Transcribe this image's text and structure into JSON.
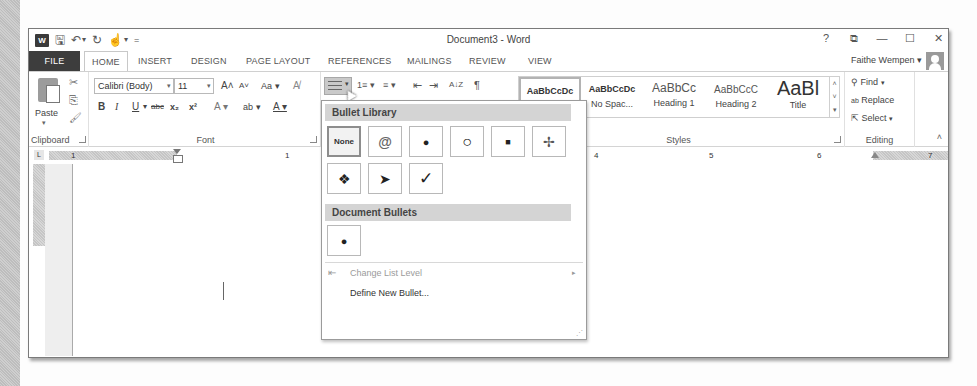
{
  "window": {
    "title": "Document3 - Word",
    "controls": [
      "?",
      "ribbon-display-options",
      "minimize",
      "maximize",
      "close"
    ],
    "control_glyphs": [
      "?",
      "⧉",
      "—",
      "☐",
      "✕"
    ],
    "user_name": "Faithe Wempen",
    "user_dropdown": "▾"
  },
  "quick_access": {
    "app_icon": "W",
    "save": "🖫",
    "undo": "↶",
    "undo_dd": "▾",
    "redo": "↻",
    "touch": "☝",
    "touch_dd": "▾",
    "customize": "="
  },
  "tabs": [
    {
      "label": "FILE",
      "x": 0
    },
    {
      "label": "HOME",
      "x": 55,
      "active": true
    },
    {
      "label": "INSERT",
      "x": 103
    },
    {
      "label": "DESIGN",
      "x": 152
    },
    {
      "label": "PAGE LAYOUT",
      "x": 207
    },
    {
      "label": "REFERENCES",
      "x": 292
    },
    {
      "label": "MAILINGS",
      "x": 371
    },
    {
      "label": "REVIEW",
      "x": 434
    },
    {
      "label": "VIEW",
      "x": 490
    }
  ],
  "ribbon": {
    "clipboard": {
      "label": "Clipboard",
      "paste_label": "Paste",
      "paste_dd": "▾",
      "cut_icon": "✂",
      "copy_icon": "⎘",
      "format_painter_icon": "🖌"
    },
    "font": {
      "label": "Font",
      "font_name": "Calibri (Body)",
      "font_size": "11",
      "grow": "A˄",
      "shrink": "A˅",
      "change_case": "Aa ▾",
      "clear_format": "A̸",
      "bold": "B",
      "italic": "I",
      "underline": "U",
      "underline_dd": "▾",
      "strikethrough": "abc",
      "subscript": "x₂",
      "superscript": "x²",
      "text_effects": "A ▾",
      "highlight": "ab ▾",
      "font_color": "A ▾"
    },
    "paragraph": {
      "numbering": "1≡ ▾",
      "multilevel": "≡ ▾",
      "decrease_indent": "⇤",
      "increase_indent": "⇥",
      "sort": "A↓Z",
      "show_marks": "¶"
    },
    "styles": {
      "label": "Styles",
      "items": [
        {
          "preview": "AaBbCcDc",
          "name": "Normal",
          "selected": true
        },
        {
          "preview": "AaBbCcDc",
          "name": "No Spac..."
        },
        {
          "preview": "AaBbCc",
          "name": "Heading 1"
        },
        {
          "preview": "AaBbCcC",
          "name": "Heading 2"
        },
        {
          "preview": "AaBl",
          "name": "Title"
        }
      ],
      "scroll_up": "˄",
      "scroll_down": "˅",
      "more": "▾"
    },
    "editing": {
      "label": "Editing",
      "find": "Find",
      "find_dd": "▾",
      "replace": "Replace",
      "select": "Select",
      "select_dd": "▾",
      "collapse": "˄"
    }
  },
  "ruler": {
    "tab_selector": "L",
    "numbers": [
      {
        "label": "1",
        "x": 70
      },
      {
        "label": "1",
        "x": 256
      },
      {
        "label": "4",
        "x": 593
      },
      {
        "label": "5",
        "x": 698
      },
      {
        "label": "6",
        "x": 803
      },
      {
        "label": "7",
        "x": 898
      }
    ]
  },
  "bullet_menu": {
    "library_header": "Bullet Library",
    "library": [
      {
        "glyph": "None",
        "name": "none",
        "selected": true
      },
      {
        "glyph": "@",
        "name": "spiral"
      },
      {
        "glyph": "●",
        "name": "filled-circle"
      },
      {
        "glyph": "○",
        "name": "hollow-circle"
      },
      {
        "glyph": "■",
        "name": "filled-square"
      },
      {
        "glyph": "✢",
        "name": "four-point"
      },
      {
        "glyph": "❖",
        "name": "diamond-cluster"
      },
      {
        "glyph": "➤",
        "name": "arrowhead"
      },
      {
        "glyph": "✓",
        "name": "checkmark"
      }
    ],
    "document_header": "Document Bullets",
    "document": [
      {
        "glyph": "●",
        "name": "filled-circle"
      }
    ],
    "change_level_icon": "⇤",
    "change_level": "Change List Level",
    "change_level_arrow": "▸",
    "define_new": "Define New Bullet...",
    "grip": "⋰"
  }
}
